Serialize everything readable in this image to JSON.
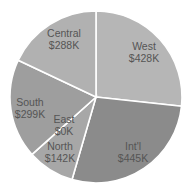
{
  "chart_data": {
    "type": "pie",
    "title": "",
    "categories": [
      "West",
      "Int'l",
      "North",
      "East",
      "South",
      "Central"
    ],
    "values": [
      428,
      445,
      142,
      0,
      299,
      288
    ],
    "value_labels": [
      "$428K",
      "$445K",
      "$142K",
      "$0K",
      "$299K",
      "$288K"
    ],
    "units": "$K",
    "start_angle": "12 o'clock",
    "direction": "clockwise",
    "colors": [
      "#b6b6b6",
      "#8b8b8b",
      "#a7a7a7",
      "#a2a2a2",
      "#9e9e9e",
      "#b1b1b1"
    ],
    "legend": "none",
    "data_labels": "inside"
  },
  "layout": {
    "cx": 96,
    "cy": 97,
    "r": 86,
    "separator_color": "#ffffff",
    "label_positions": [
      {
        "x": 144,
        "y": 50
      },
      {
        "x": 133,
        "y": 150
      },
      {
        "x": 60,
        "y": 150
      },
      {
        "x": 64,
        "y": 123
      },
      {
        "x": 30,
        "y": 106
      },
      {
        "x": 64,
        "y": 37
      }
    ]
  }
}
